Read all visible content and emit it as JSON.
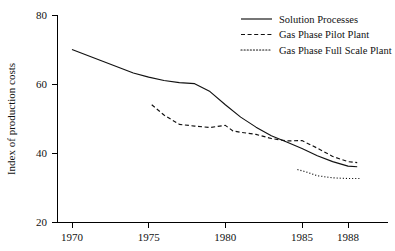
{
  "chart_data": {
    "type": "line",
    "title": "",
    "xlabel": "",
    "ylabel": "Index of production costs",
    "xlim": [
      1970,
      1989.5
    ],
    "ylim": [
      20,
      80
    ],
    "grid": false,
    "legend_position": "top-right",
    "xticks": [
      1970,
      1975,
      1980,
      1985,
      1988
    ],
    "xticklabels": [
      "1970",
      "1975",
      "1980",
      "1985",
      "1988"
    ],
    "yticks": [
      20,
      40,
      60,
      80
    ],
    "yticklabels": [
      "20",
      "40",
      "60",
      "80"
    ],
    "series": [
      {
        "name": "Solution Processes",
        "style": "solid",
        "color": "#111111",
        "x": [
          1970,
          1972,
          1974,
          1975,
          1976,
          1977,
          1978,
          1979,
          1980,
          1981,
          1982,
          1983,
          1984,
          1985,
          1986,
          1987,
          1988,
          1988.6
        ],
        "values": [
          70.0,
          66.6,
          63.2,
          62.0,
          61.0,
          60.4,
          60.1,
          57.8,
          54.0,
          50.4,
          47.5,
          45.0,
          43.2,
          41.3,
          39.2,
          37.5,
          36.2,
          36.0
        ]
      },
      {
        "name": "Gas Phase Pilot Plant",
        "style": "dashed",
        "color": "#111111",
        "x": [
          1975.2,
          1976,
          1977,
          1978,
          1979,
          1980,
          1980.5,
          1981,
          1982,
          1983,
          1984,
          1985,
          1986,
          1987,
          1988,
          1988.6
        ],
        "values": [
          54.0,
          51.0,
          48.3,
          47.8,
          47.4,
          48.0,
          46.4,
          46.0,
          45.4,
          44.2,
          43.5,
          43.6,
          41.4,
          39.0,
          37.5,
          37.2
        ]
      },
      {
        "name": "Gas Phase Full Scale Plant",
        "style": "dotted",
        "color": "#111111",
        "x": [
          1984.7,
          1985.2,
          1986,
          1987,
          1988,
          1988.8
        ],
        "values": [
          35.2,
          34.6,
          33.4,
          32.8,
          32.6,
          32.6
        ]
      }
    ]
  },
  "legend": {
    "items": [
      {
        "label": "Solution Processes",
        "style": "solid"
      },
      {
        "label": "Gas Phase Pilot Plant",
        "style": "dashed"
      },
      {
        "label": "Gas Phase Full Scale Plant",
        "style": "dotted"
      }
    ]
  },
  "axes": {
    "y_title": "Index of production costs"
  }
}
